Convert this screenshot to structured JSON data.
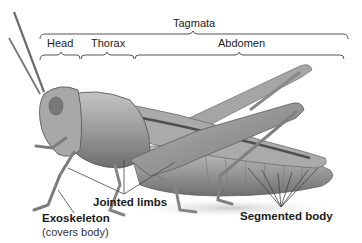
{
  "diagram": {
    "brackets": {
      "top": {
        "label": "Tagmata"
      },
      "segments": [
        {
          "label": "Head"
        },
        {
          "label": "Thorax"
        },
        {
          "label": "Abdomen"
        }
      ]
    },
    "callouts": [
      {
        "label": "Jointed limbs"
      },
      {
        "label": "Exoskeleton",
        "sublabel": "(covers body)"
      },
      {
        "label": "Segmented body"
      }
    ],
    "colors": {
      "text": "#222222",
      "bracket": "#555555",
      "leader": "#444444",
      "body_light": "#b9b9b9",
      "body_mid": "#8f8f8f",
      "body_dark": "#5a5a5a"
    }
  }
}
